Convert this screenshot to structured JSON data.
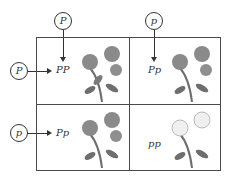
{
  "top_parents": [
    {
      "allele": "P"
    },
    {
      "allele": "p"
    }
  ],
  "side_parents": [
    {
      "allele": "P"
    },
    {
      "allele": "p"
    }
  ],
  "cells": [
    {
      "genotype": "PP",
      "flower": "purple"
    },
    {
      "genotype": "Pp",
      "flower": "purple"
    },
    {
      "genotype": "Pp",
      "flower": "purple"
    },
    {
      "genotype": "pp",
      "flower": "white"
    }
  ],
  "colors": {
    "purple_flower": "#8a8a8a",
    "white_flower": "#efefef",
    "leaf": "#6e6e6e",
    "line": "#4a4a4a"
  }
}
